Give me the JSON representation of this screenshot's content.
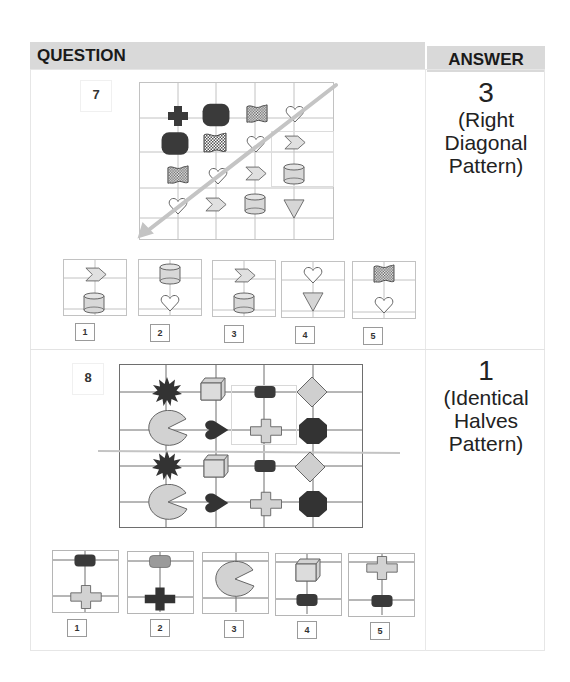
{
  "header": {
    "question_label": "QUESTION",
    "answer_label": "ANSWER"
  },
  "colors": {
    "header_bg": "#d9d9d9",
    "grid_line": "#bdbdbd",
    "dark_shape": "#3a3a3a",
    "light_shape": "#d4d4d4",
    "arrow": "#c4c4c4"
  },
  "questions": [
    {
      "number": "7",
      "grid": {
        "cols": 5,
        "rows": 5,
        "cells": [
          [
            "",
            "cross-dark",
            "rounded-rect-dark",
            "flag-checkered",
            "heart"
          ],
          [
            "rounded-rect-dark",
            "flag-checkered",
            "heart",
            "chevron",
            ""
          ],
          [
            "flag-checkered",
            "heart",
            "chevron",
            "cylinder",
            ""
          ],
          [
            "heart",
            "chevron",
            "cylinder",
            "triangle-down",
            ""
          ],
          [
            "",
            "",
            "",
            "",
            ""
          ]
        ],
        "overlay": "diagonal-arrow-top-right-to-bottom-left"
      },
      "options": [
        {
          "label": "1",
          "top": "chevron",
          "bottom": "cylinder"
        },
        {
          "label": "2",
          "top": "cylinder",
          "bottom": "heart"
        },
        {
          "label": "3",
          "top": "chevron",
          "bottom": "cylinder"
        },
        {
          "label": "4",
          "top": "heart",
          "bottom": "triangle-down"
        },
        {
          "label": "5",
          "top": "flag-checkered",
          "bottom": "heart"
        }
      ],
      "answer": {
        "number": "3",
        "line1": "(Right",
        "line2": "Diagonal",
        "line3": "Pattern)"
      }
    },
    {
      "number": "8",
      "grid": {
        "cols": 5,
        "rows": 4,
        "cells": [
          [
            "starburst-dark",
            "cube",
            "rounded-rect-dark",
            "diamond"
          ],
          [
            "pacman",
            "heart-dark",
            "cross-light",
            "octagon-dark"
          ],
          [
            "starburst-dark",
            "cube",
            "rounded-rect-dark",
            "diamond"
          ],
          [
            "pacman",
            "heart-dark",
            "cross-light",
            "octagon-dark"
          ]
        ],
        "overlay": "horizontal-cut-line"
      },
      "options": [
        {
          "label": "1",
          "top": "rounded-rect-dark",
          "bottom": "cross-light"
        },
        {
          "label": "2",
          "top": "rounded-rect-mid",
          "bottom": "cross-dark"
        },
        {
          "label": "3",
          "top": "pacman",
          "bottom": ""
        },
        {
          "label": "4",
          "top": "cube",
          "bottom": "rounded-rect-dark"
        },
        {
          "label": "5",
          "top": "cross-light",
          "bottom": "rounded-rect-dark"
        }
      ],
      "answer": {
        "number": "1",
        "line1": "(Identical",
        "line2": "Halves",
        "line3": "Pattern)"
      }
    }
  ]
}
